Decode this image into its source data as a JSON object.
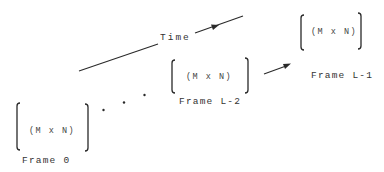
{
  "diagram": {
    "time_axis": {
      "label": "Time"
    },
    "frames": [
      {
        "id": "frame-0",
        "label": "Frame 0",
        "dimension": "(M x N)"
      },
      {
        "id": "frame-l-2",
        "label": "Frame L-2",
        "dimension": "(M x N)"
      },
      {
        "id": "frame-l-1",
        "label": "Frame L-1",
        "dimension": "(M x N)"
      }
    ],
    "ellipsis": "...",
    "colors": {
      "stroke": "#2a2a2a",
      "text": "#333333",
      "background": "#ffffff"
    }
  }
}
